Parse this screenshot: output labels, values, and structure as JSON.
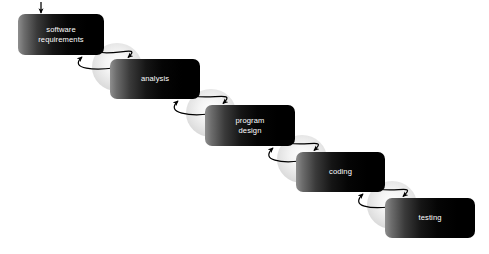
{
  "diagram": {
    "background_color": "#ffffff",
    "box_text_color": "#ffffff",
    "box_gradient_from": "#8e8e8e",
    "box_gradient_to": "#000000",
    "connector_color": "#000000",
    "blob_color": "#e9e9e9",
    "entry_arrow": {
      "name": "entry-arrow",
      "target": "software requirements",
      "direction": "down"
    },
    "stages": [
      {
        "id": "software-requirements",
        "label": "software\nrequirements",
        "order": 1,
        "x": 18,
        "y": 14,
        "width": 86,
        "height": 41
      },
      {
        "id": "analysis",
        "label": "analysis",
        "order": 2,
        "x": 110,
        "y": 59,
        "width": 90,
        "height": 40
      },
      {
        "id": "program-design",
        "label": "program\ndesign",
        "order": 3,
        "x": 205,
        "y": 105,
        "width": 90,
        "height": 41
      },
      {
        "id": "coding",
        "label": "coding",
        "order": 4,
        "x": 296,
        "y": 152,
        "width": 89,
        "height": 40
      },
      {
        "id": "testing",
        "label": "testing",
        "order": 5,
        "x": 385,
        "y": 198,
        "width": 90,
        "height": 40
      }
    ],
    "connectors": [
      {
        "id": "connector-1",
        "from": "software-requirements",
        "to": "analysis",
        "forward_label": "",
        "feedback_label": "",
        "blob_cx": 117,
        "blob_cy": 67,
        "blob_rx": 25,
        "blob_ry": 24
      },
      {
        "id": "connector-2",
        "from": "analysis",
        "to": "program-design",
        "forward_label": "",
        "feedback_label": "",
        "blob_cx": 211,
        "blob_cy": 113,
        "blob_rx": 25,
        "blob_ry": 24
      },
      {
        "id": "connector-3",
        "from": "program-design",
        "to": "coding",
        "forward_label": "",
        "feedback_label": "",
        "blob_cx": 302,
        "blob_cy": 159,
        "blob_rx": 25,
        "blob_ry": 24
      },
      {
        "id": "connector-4",
        "from": "coding",
        "to": "testing",
        "forward_label": "",
        "feedback_label": "",
        "blob_cx": 392,
        "blob_cy": 205,
        "blob_rx": 25,
        "blob_ry": 24
      }
    ]
  }
}
